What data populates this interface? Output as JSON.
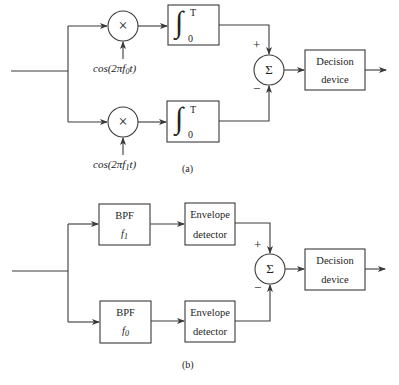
{
  "diagram_a": {
    "caption": "(a)",
    "top_branch": {
      "multiplier_symbol": "×",
      "carrier_label": {
        "prefix": "cos(2π",
        "var": "f",
        "sub": "0",
        "suffix": "t)"
      },
      "integrator": {
        "symbol": "∫",
        "upper": "T",
        "lower": "0"
      },
      "sign": "+"
    },
    "bottom_branch": {
      "multiplier_symbol": "×",
      "carrier_label": {
        "prefix": "cos(2π",
        "var": "f",
        "sub": "1",
        "suffix": "t)"
      },
      "integrator": {
        "symbol": "∫",
        "upper": "T",
        "lower": "0"
      },
      "sign": "−"
    },
    "summer_symbol": "Σ",
    "decision": {
      "line1": "Decision",
      "line2": "device"
    }
  },
  "diagram_b": {
    "caption": "(b)",
    "top_branch": {
      "filter": {
        "line1": "BPF",
        "var": "f",
        "sub": "1"
      },
      "detector": {
        "line1": "Envelope",
        "line2": "detector"
      },
      "sign": "+"
    },
    "bottom_branch": {
      "filter": {
        "line1": "BPF",
        "var": "f",
        "sub": "0"
      },
      "detector": {
        "line1": "Envelope",
        "line2": "detector"
      },
      "sign": "−"
    },
    "summer_symbol": "Σ",
    "decision": {
      "line1": "Decision",
      "line2": "device"
    }
  },
  "colors": {
    "line": "#3a3a3a",
    "background": "#ffffff",
    "text": "#222222"
  }
}
